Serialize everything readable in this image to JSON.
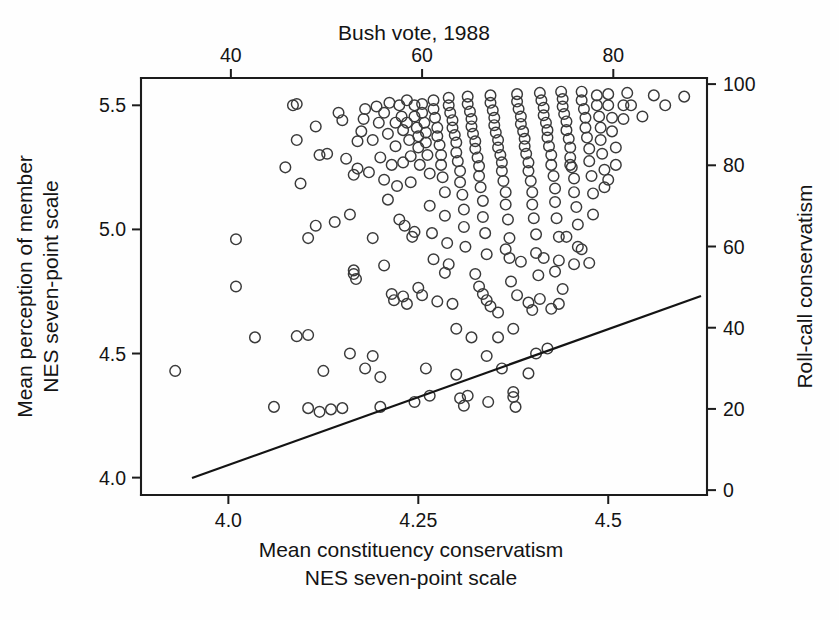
{
  "figure": {
    "background": "#fefefe",
    "marker_color": "#3a3a3a",
    "line_color": "#141414",
    "axis_color": "#1c1c1c"
  },
  "labels": {
    "top_title": "Bush vote, 1988",
    "left_axis_line1": "Mean perception of member",
    "left_axis_line2": "NES seven-point scale",
    "right_axis_title": "Roll-call conservatism",
    "bottom_axis_line1": "Mean constituency conservatism",
    "bottom_axis_line2": "NES seven-point scale"
  },
  "ticks": {
    "top": [
      "40",
      "60",
      "80"
    ],
    "bottom": [
      "4.0",
      "4.25",
      "4.5"
    ],
    "left": [
      "5.5",
      "5.0",
      "4.5",
      "4.0"
    ],
    "right": [
      "100",
      "80",
      "60",
      "40",
      "20",
      "0"
    ]
  },
  "chart_data": {
    "type": "scatter",
    "title": "Bush vote, 1988",
    "xlabel": "Mean constituency conservatism NES seven-point scale",
    "ylabel": "Mean perception of member NES seven-point scale",
    "xlabel_top": "Bush vote, 1988",
    "ylabel_right": "Roll-call conservatism",
    "grid": false,
    "legend": null,
    "xlim": [
      3.885,
      4.63
    ],
    "ylim": [
      3.93,
      5.61
    ],
    "xticks": [
      4.0,
      4.25,
      4.5
    ],
    "xticklabels": [
      "4.0",
      "4.25",
      "4.5"
    ],
    "yticks": [
      4.0,
      4.5,
      5.0,
      5.5
    ],
    "yticklabels": [
      "4.0",
      "4.5",
      "5.0",
      "5.5"
    ],
    "xlim_top": [
      30.6,
      89.8
    ],
    "xticks_top": [
      40,
      60,
      80
    ],
    "xticklabels_top": [
      "40",
      "60",
      "80"
    ],
    "ylim_right": [
      -1.2,
      101.5
    ],
    "yticks_right": [
      0,
      20,
      40,
      60,
      80,
      100
    ],
    "yticklabels_right": [
      "0",
      "20",
      "40",
      "60",
      "80",
      "100"
    ],
    "marker": "open-circle",
    "marker_size_px": 12,
    "fit_line": {
      "label": "regression line",
      "x": [
        4.018,
        4.873
      ],
      "y": [
        3.962,
        4.728
      ],
      "x_pixels": [
        192,
        701
      ],
      "y_pixels": [
        478,
        296
      ]
    },
    "points": [
      [
        3.93,
        4.43
      ],
      [
        4.01,
        4.96
      ],
      [
        4.01,
        4.77
      ],
      [
        4.035,
        4.565
      ],
      [
        4.06,
        4.285
      ],
      [
        4.075,
        5.25
      ],
      [
        4.085,
        5.5
      ],
      [
        4.09,
        5.36
      ],
      [
        4.095,
        5.185
      ],
      [
        4.105,
        4.965
      ],
      [
        4.105,
        4.575
      ],
      [
        4.105,
        4.28
      ],
      [
        4.115,
        5.415
      ],
      [
        4.12,
        5.3
      ],
      [
        4.12,
        4.265
      ],
      [
        4.13,
        5.305
      ],
      [
        4.135,
        4.275
      ],
      [
        4.145,
        5.47
      ],
      [
        4.15,
        5.44
      ],
      [
        4.155,
        5.285
      ],
      [
        4.16,
        5.06
      ],
      [
        4.165,
        4.835
      ],
      [
        4.165,
        4.82
      ],
      [
        4.168,
        4.8
      ],
      [
        4.17,
        5.355
      ],
      [
        4.17,
        5.245
      ],
      [
        4.175,
        5.395
      ],
      [
        4.178,
        5.445
      ],
      [
        4.18,
        5.485
      ],
      [
        4.18,
        4.44
      ],
      [
        4.185,
        5.23
      ],
      [
        4.19,
        5.36
      ],
      [
        4.19,
        4.965
      ],
      [
        4.195,
        5.495
      ],
      [
        4.198,
        5.43
      ],
      [
        4.2,
        5.29
      ],
      [
        4.2,
        4.405
      ],
      [
        4.205,
        5.47
      ],
      [
        4.205,
        5.2
      ],
      [
        4.21,
        5.385
      ],
      [
        4.212,
        5.51
      ],
      [
        4.215,
        5.26
      ],
      [
        4.215,
        4.74
      ],
      [
        4.218,
        4.715
      ],
      [
        4.22,
        5.43
      ],
      [
        4.22,
        5.335
      ],
      [
        4.222,
        5.175
      ],
      [
        4.225,
        5.5
      ],
      [
        4.228,
        5.455
      ],
      [
        4.23,
        5.4
      ],
      [
        4.23,
        5.27
      ],
      [
        4.232,
        5.015
      ],
      [
        4.235,
        5.52
      ],
      [
        4.235,
        5.43
      ],
      [
        4.238,
        5.36
      ],
      [
        4.24,
        5.295
      ],
      [
        4.24,
        5.19
      ],
      [
        4.242,
        4.97
      ],
      [
        4.245,
        5.5
      ],
      [
        4.245,
        5.455
      ],
      [
        4.248,
        5.41
      ],
      [
        4.25,
        5.375
      ],
      [
        4.25,
        5.33
      ],
      [
        4.252,
        5.26
      ],
      [
        4.255,
        5.505
      ],
      [
        4.255,
        5.47
      ],
      [
        4.258,
        5.43
      ],
      [
        4.26,
        5.39
      ],
      [
        4.26,
        5.35
      ],
      [
        4.262,
        5.3
      ],
      [
        4.265,
        5.225
      ],
      [
        4.265,
        5.095
      ],
      [
        4.268,
        4.985
      ],
      [
        4.27,
        5.52
      ],
      [
        4.27,
        5.485
      ],
      [
        4.272,
        5.45
      ],
      [
        4.275,
        5.41
      ],
      [
        4.275,
        5.375
      ],
      [
        4.278,
        5.34
      ],
      [
        4.28,
        5.3
      ],
      [
        4.28,
        5.26
      ],
      [
        4.282,
        5.21
      ],
      [
        4.285,
        5.15
      ],
      [
        4.285,
        5.055
      ],
      [
        4.288,
        4.945
      ],
      [
        4.29,
        5.53
      ],
      [
        4.29,
        5.5
      ],
      [
        4.292,
        5.47
      ],
      [
        4.295,
        5.44
      ],
      [
        4.295,
        5.41
      ],
      [
        4.298,
        5.38
      ],
      [
        4.3,
        5.35
      ],
      [
        4.3,
        5.31
      ],
      [
        4.302,
        5.275
      ],
      [
        4.305,
        5.235
      ],
      [
        4.305,
        5.19
      ],
      [
        4.308,
        5.14
      ],
      [
        4.31,
        5.08
      ],
      [
        4.31,
        5.01
      ],
      [
        4.312,
        4.93
      ],
      [
        4.315,
        5.535
      ],
      [
        4.315,
        5.505
      ],
      [
        4.318,
        5.475
      ],
      [
        4.32,
        5.445
      ],
      [
        4.32,
        5.415
      ],
      [
        4.322,
        5.385
      ],
      [
        4.325,
        5.355
      ],
      [
        4.325,
        5.325
      ],
      [
        4.328,
        5.29
      ],
      [
        4.33,
        5.255
      ],
      [
        4.33,
        5.215
      ],
      [
        4.332,
        5.17
      ],
      [
        4.335,
        5.115
      ],
      [
        4.335,
        5.05
      ],
      [
        4.338,
        4.985
      ],
      [
        4.34,
        4.9
      ],
      [
        4.34,
        4.715
      ],
      [
        4.342,
        4.305
      ],
      [
        4.345,
        5.54
      ],
      [
        4.345,
        5.51
      ],
      [
        4.348,
        5.48
      ],
      [
        4.35,
        5.45
      ],
      [
        4.35,
        5.42
      ],
      [
        4.352,
        5.39
      ],
      [
        4.355,
        5.36
      ],
      [
        4.355,
        5.33
      ],
      [
        4.358,
        5.3
      ],
      [
        4.36,
        5.27
      ],
      [
        4.36,
        5.235
      ],
      [
        4.362,
        5.195
      ],
      [
        4.365,
        5.15
      ],
      [
        4.365,
        5.1
      ],
      [
        4.368,
        5.04
      ],
      [
        4.37,
        4.965
      ],
      [
        4.37,
        4.885
      ],
      [
        4.372,
        4.79
      ],
      [
        4.375,
        4.345
      ],
      [
        4.375,
        4.325
      ],
      [
        4.378,
        4.285
      ],
      [
        4.38,
        5.545
      ],
      [
        4.38,
        5.515
      ],
      [
        4.382,
        5.485
      ],
      [
        4.385,
        5.455
      ],
      [
        4.385,
        5.425
      ],
      [
        4.388,
        5.395
      ],
      [
        4.39,
        5.365
      ],
      [
        4.39,
        5.335
      ],
      [
        4.392,
        5.305
      ],
      [
        4.395,
        5.27
      ],
      [
        4.395,
        5.235
      ],
      [
        4.398,
        5.195
      ],
      [
        4.4,
        5.15
      ],
      [
        4.4,
        5.1
      ],
      [
        4.402,
        5.045
      ],
      [
        4.405,
        4.98
      ],
      [
        4.405,
        4.905
      ],
      [
        4.408,
        4.815
      ],
      [
        4.41,
        4.72
      ],
      [
        4.41,
        5.55
      ],
      [
        4.412,
        5.52
      ],
      [
        4.415,
        5.49
      ],
      [
        4.415,
        5.46
      ],
      [
        4.418,
        5.43
      ],
      [
        4.42,
        5.4
      ],
      [
        4.42,
        5.37
      ],
      [
        4.422,
        5.335
      ],
      [
        4.425,
        5.3
      ],
      [
        4.425,
        5.26
      ],
      [
        4.428,
        5.215
      ],
      [
        4.43,
        5.165
      ],
      [
        4.43,
        5.11
      ],
      [
        4.432,
        5.045
      ],
      [
        4.435,
        4.97
      ],
      [
        4.435,
        4.875
      ],
      [
        4.438,
        5.555
      ],
      [
        4.44,
        5.525
      ],
      [
        4.44,
        5.495
      ],
      [
        4.442,
        5.465
      ],
      [
        4.445,
        5.435
      ],
      [
        4.445,
        5.4
      ],
      [
        4.448,
        5.365
      ],
      [
        4.45,
        5.33
      ],
      [
        4.45,
        5.29
      ],
      [
        4.452,
        5.25
      ],
      [
        4.455,
        5.205
      ],
      [
        4.455,
        5.15
      ],
      [
        4.458,
        5.09
      ],
      [
        4.46,
        5.02
      ],
      [
        4.46,
        4.93
      ],
      [
        4.465,
        5.555
      ],
      [
        4.465,
        5.52
      ],
      [
        4.468,
        5.485
      ],
      [
        4.47,
        5.45
      ],
      [
        4.47,
        5.41
      ],
      [
        4.472,
        5.37
      ],
      [
        4.475,
        5.325
      ],
      [
        4.475,
        5.275
      ],
      [
        4.478,
        5.215
      ],
      [
        4.48,
        5.145
      ],
      [
        4.48,
        5.06
      ],
      [
        4.485,
        5.54
      ],
      [
        4.485,
        5.5
      ],
      [
        4.488,
        5.455
      ],
      [
        4.49,
        5.41
      ],
      [
        4.49,
        5.36
      ],
      [
        4.492,
        5.305
      ],
      [
        4.495,
        5.24
      ],
      [
        4.495,
        5.17
      ],
      [
        4.5,
        5.545
      ],
      [
        4.5,
        5.5
      ],
      [
        4.505,
        5.45
      ],
      [
        4.505,
        5.395
      ],
      [
        4.51,
        5.33
      ],
      [
        4.51,
        5.26
      ],
      [
        4.52,
        5.5
      ],
      [
        4.52,
        5.445
      ],
      [
        4.525,
        5.55
      ],
      [
        4.53,
        5.5
      ],
      [
        4.545,
        5.455
      ],
      [
        4.56,
        5.54
      ],
      [
        4.575,
        5.5
      ],
      [
        4.6,
        5.535
      ],
      [
        4.09,
        5.505
      ],
      [
        4.14,
        5.03
      ],
      [
        4.16,
        4.5
      ],
      [
        4.19,
        4.49
      ],
      [
        4.2,
        4.285
      ],
      [
        4.23,
        4.73
      ],
      [
        4.235,
        4.7
      ],
      [
        4.245,
        4.99
      ],
      [
        4.25,
        4.765
      ],
      [
        4.255,
        4.735
      ],
      [
        4.27,
        4.88
      ],
      [
        4.285,
        4.825
      ],
      [
        4.295,
        4.7
      ],
      [
        4.3,
        4.415
      ],
      [
        4.305,
        4.32
      ],
      [
        4.31,
        4.29
      ],
      [
        4.315,
        4.33
      ],
      [
        4.325,
        4.82
      ],
      [
        4.33,
        4.77
      ],
      [
        4.335,
        4.74
      ],
      [
        4.345,
        4.69
      ],
      [
        4.355,
        4.665
      ],
      [
        4.365,
        4.92
      ],
      [
        4.385,
        4.87
      ],
      [
        4.395,
        4.705
      ],
      [
        4.4,
        4.675
      ],
      [
        4.415,
        4.885
      ],
      [
        4.43,
        4.83
      ],
      [
        4.44,
        4.76
      ],
      [
        4.45,
        5.26
      ],
      [
        4.455,
        4.86
      ],
      [
        4.09,
        4.57
      ],
      [
        4.125,
        4.43
      ],
      [
        4.15,
        4.28
      ],
      [
        4.21,
        5.12
      ],
      [
        4.225,
        5.04
      ],
      [
        4.26,
        4.44
      ],
      [
        4.275,
        4.71
      ],
      [
        4.29,
        4.86
      ],
      [
        4.34,
        4.49
      ],
      [
        4.36,
        4.44
      ],
      [
        4.38,
        4.735
      ],
      [
        4.405,
        4.5
      ],
      [
        4.42,
        4.52
      ],
      [
        4.445,
        4.97
      ],
      [
        4.465,
        4.92
      ],
      [
        4.475,
        4.865
      ],
      [
        4.5,
        5.2
      ],
      [
        4.115,
        5.015
      ],
      [
        4.165,
        5.22
      ],
      [
        4.205,
        4.855
      ],
      [
        4.245,
        4.305
      ],
      [
        4.265,
        4.33
      ],
      [
        4.3,
        4.6
      ],
      [
        4.32,
        4.565
      ],
      [
        4.355,
        4.565
      ],
      [
        4.375,
        4.6
      ],
      [
        4.395,
        4.42
      ],
      [
        4.425,
        4.68
      ],
      [
        4.435,
        4.7
      ]
    ]
  }
}
